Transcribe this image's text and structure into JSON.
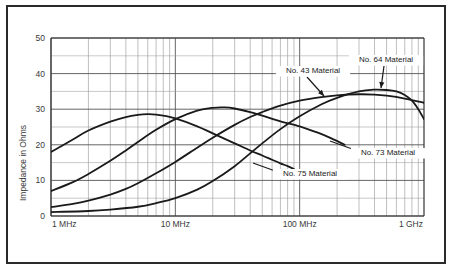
{
  "chart_data": {
    "type": "line",
    "title": "",
    "xlabel": "",
    "ylabel": "Impedance in Ohms",
    "xscale": "log",
    "xlim": [
      1000000,
      1000000000
    ],
    "ylim": [
      0,
      50
    ],
    "grid": true,
    "legend_position": "inline-annotations",
    "x_tick_labels": [
      "1 MHz",
      "10 MHz",
      "100 MHz",
      "1 GHz"
    ],
    "x_tick_values": [
      1000000,
      10000000,
      100000000,
      1000000000
    ],
    "y_tick_labels": [
      "0",
      "10",
      "20",
      "30",
      "40",
      "50"
    ],
    "y_tick_values": [
      0,
      10,
      20,
      30,
      40,
      50
    ],
    "y_minor_step": 5,
    "series": [
      {
        "name": "No. 75 Material",
        "label": "No. 75 Material",
        "color": "#1a1a1a",
        "points_mhz_ohms": [
          [
            1,
            18.0
          ],
          [
            1.5,
            21.5
          ],
          [
            2,
            24.0
          ],
          [
            3,
            26.5
          ],
          [
            4,
            27.8
          ],
          [
            5,
            28.4
          ],
          [
            6,
            28.6
          ],
          [
            7,
            28.5
          ],
          [
            8,
            28.2
          ],
          [
            10,
            27.4
          ],
          [
            15,
            25.2
          ],
          [
            20,
            23.2
          ],
          [
            30,
            20.4
          ],
          [
            40,
            18.4
          ],
          [
            50,
            17.0
          ],
          [
            60,
            15.8
          ],
          [
            70,
            14.8
          ],
          [
            80,
            14.0
          ],
          [
            90,
            13.2
          ]
        ]
      },
      {
        "name": "No. 73 Material",
        "label": "No. 73 Material",
        "color": "#1a1a1a",
        "points_mhz_ohms": [
          [
            1,
            7.0
          ],
          [
            1.5,
            9.5
          ],
          [
            2,
            11.8
          ],
          [
            3,
            15.5
          ],
          [
            4,
            18.4
          ],
          [
            5,
            20.8
          ],
          [
            7,
            24.2
          ],
          [
            10,
            27.2
          ],
          [
            15,
            29.6
          ],
          [
            20,
            30.4
          ],
          [
            25,
            30.5
          ],
          [
            30,
            30.2
          ],
          [
            40,
            29.2
          ],
          [
            50,
            28.2
          ],
          [
            70,
            26.6
          ],
          [
            100,
            25.2
          ],
          [
            140,
            23.4
          ],
          [
            180,
            21.8
          ],
          [
            230,
            20.0
          ]
        ]
      },
      {
        "name": "No. 43 Material",
        "label": "No. 43 Material",
        "color": "#1a1a1a",
        "points_mhz_ohms": [
          [
            1,
            2.5
          ],
          [
            1.5,
            3.4
          ],
          [
            2,
            4.3
          ],
          [
            3,
            6.0
          ],
          [
            4,
            7.6
          ],
          [
            5,
            9.2
          ],
          [
            7,
            12.0
          ],
          [
            10,
            15.2
          ],
          [
            15,
            19.2
          ],
          [
            20,
            22.0
          ],
          [
            30,
            25.6
          ],
          [
            40,
            27.8
          ],
          [
            50,
            29.2
          ],
          [
            70,
            31.0
          ],
          [
            100,
            32.4
          ],
          [
            150,
            33.4
          ],
          [
            200,
            33.9
          ],
          [
            300,
            34.2
          ],
          [
            400,
            34.1
          ],
          [
            500,
            33.8
          ],
          [
            700,
            33.0
          ],
          [
            1000,
            31.8
          ]
        ]
      },
      {
        "name": "No. 64 Material",
        "label": "No. 64 Material",
        "color": "#1a1a1a",
        "points_mhz_ohms": [
          [
            1,
            1.1
          ],
          [
            2,
            1.4
          ],
          [
            3,
            1.8
          ],
          [
            5,
            2.6
          ],
          [
            7,
            3.6
          ],
          [
            10,
            5.0
          ],
          [
            15,
            7.4
          ],
          [
            20,
            9.8
          ],
          [
            30,
            14.0
          ],
          [
            40,
            17.6
          ],
          [
            50,
            20.4
          ],
          [
            70,
            24.4
          ],
          [
            100,
            28.0
          ],
          [
            150,
            31.4
          ],
          [
            200,
            33.2
          ],
          [
            300,
            35.0
          ],
          [
            400,
            35.5
          ],
          [
            500,
            35.4
          ],
          [
            600,
            35.0
          ],
          [
            700,
            34.0
          ],
          [
            800,
            32.4
          ],
          [
            900,
            30.0
          ],
          [
            1000,
            27.2
          ]
        ]
      }
    ],
    "annotations": [
      {
        "text": "No. 43 Material",
        "series": "No. 43 Material",
        "label_x": 313,
        "label_y": 73,
        "leader_from_x": 307,
        "leader_from_y": 77,
        "leader_to_x": 324,
        "leader_to_y": 96,
        "has_arrow": true
      },
      {
        "text": "No. 64 Material",
        "series": "No. 64 Material",
        "label_x": 386,
        "label_y": 62,
        "leader_from_x": 384,
        "leader_from_y": 66,
        "leader_to_x": 381,
        "leader_to_y": 88,
        "has_arrow": true
      },
      {
        "text": "No. 73 Material",
        "series": "No. 73 Material",
        "label_x": 388,
        "label_y": 155,
        "leader_from_x": 355,
        "leader_from_y": 150,
        "leader_to_x": 330,
        "leader_to_y": 141,
        "has_arrow": false
      },
      {
        "text": "No. 75 Material",
        "series": "No. 75 Material",
        "label_x": 310,
        "label_y": 176,
        "leader_from_x": 278,
        "leader_from_y": 172,
        "leader_to_x": 253,
        "leader_to_y": 163,
        "has_arrow": false
      }
    ]
  },
  "axis": {
    "y_title": "Impedance in Ohms"
  }
}
